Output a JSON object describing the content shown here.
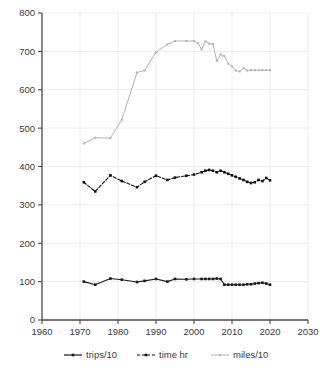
{
  "chart_data": {
    "type": "line",
    "title": "",
    "subtitle": "",
    "xlabel": "",
    "ylabel": "",
    "xlim": [
      1960,
      2030
    ],
    "ylim": [
      0,
      800
    ],
    "xticks": [
      1960,
      1970,
      1980,
      1990,
      2000,
      2010,
      2020,
      2030
    ],
    "yticks": [
      0,
      100,
      200,
      300,
      400,
      500,
      600,
      700,
      800
    ],
    "grid": true,
    "legend_position": "bottom",
    "series": [
      {
        "name": "trips/10",
        "color": "#1a1a1a",
        "line_style": "solid",
        "marker": "square",
        "x": [
          1971,
          1974,
          1978,
          1981,
          1985,
          1987,
          1990,
          1993,
          1995,
          1998,
          2000,
          2002,
          2003,
          2004,
          2005,
          2006,
          2007,
          2008,
          2009,
          2010,
          2011,
          2012,
          2013,
          2014,
          2015,
          2016,
          2017,
          2018,
          2019,
          2020
        ],
        "values": [
          100,
          92,
          108,
          105,
          99,
          102,
          107,
          100,
          107,
          106,
          107,
          107,
          107,
          107,
          107,
          108,
          107,
          92,
          92,
          92,
          92,
          92,
          92,
          93,
          93,
          95,
          96,
          97,
          95,
          92
        ]
      },
      {
        "name": "time hr",
        "color": "#111111",
        "line_style": "dashed",
        "marker": "square",
        "x": [
          1971,
          1974,
          1978,
          1981,
          1985,
          1987,
          1990,
          1993,
          1995,
          1998,
          2000,
          2002,
          2003,
          2004,
          2005,
          2006,
          2007,
          2008,
          2009,
          2010,
          2011,
          2012,
          2013,
          2014,
          2015,
          2016,
          2017,
          2018,
          2019,
          2020
        ],
        "values": [
          359,
          335,
          377,
          362,
          346,
          360,
          376,
          365,
          371,
          376,
          379,
          385,
          389,
          391,
          389,
          385,
          389,
          385,
          381,
          377,
          373,
          369,
          365,
          360,
          357,
          359,
          365,
          362,
          370,
          364
        ]
      },
      {
        "name": "miles/10",
        "color": "#b3b3b3",
        "line_style": "solid",
        "marker": "square",
        "x": [
          1971,
          1974,
          1978,
          1981,
          1985,
          1987,
          1990,
          1993,
          1995,
          1998,
          2000,
          2001,
          2002,
          2003,
          2004,
          2005,
          2006,
          2007,
          2008,
          2009,
          2010,
          2011,
          2012,
          2013,
          2014,
          2015,
          2016,
          2017,
          2018,
          2019,
          2020
        ],
        "values": [
          460,
          475,
          474,
          522,
          645,
          650,
          698,
          718,
          727,
          727,
          727,
          722,
          705,
          726,
          720,
          719,
          675,
          692,
          688,
          668,
          661,
          650,
          648,
          656,
          650,
          651,
          651,
          651,
          651,
          651,
          651
        ]
      }
    ]
  },
  "legend": {
    "entries": [
      {
        "label": "trips/10"
      },
      {
        "label": "time hr"
      },
      {
        "label": "miles/10"
      }
    ]
  },
  "axis": {
    "x_tick_labels": [
      "1960",
      "1970",
      "1980",
      "1990",
      "2000",
      "2010",
      "2020",
      "2030"
    ],
    "y_tick_labels": [
      "0",
      "100",
      "200",
      "300",
      "400",
      "500",
      "600",
      "700",
      "800"
    ]
  }
}
